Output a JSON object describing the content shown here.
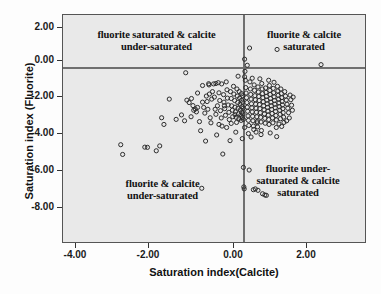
{
  "chart_data": {
    "type": "scatter",
    "title": "",
    "xlabel": "Saturation index(Calcite)",
    "ylabel": "Saturation index (Fluorite)",
    "xlim": [
      -4.7,
      3.2
    ],
    "ylim": [
      -8.6,
      2.6
    ],
    "xticks": [
      "-4.00",
      "-2.00",
      "0.00",
      "2.00"
    ],
    "xtick_values": [
      -4,
      -2,
      0,
      2
    ],
    "yticks": [
      "2.00",
      "0.00",
      "-2.00",
      "-4.00",
      "-6.00",
      "-8.00"
    ],
    "ytick_values": [
      2,
      0,
      -2,
      -4,
      -6,
      -8
    ],
    "grid": false,
    "legend": "none",
    "marker": "open-circle",
    "marker_color": "#2b2b2b",
    "plot_background": "#e9e9e9",
    "reference_lines": [
      {
        "axis": "x",
        "value": 0,
        "color": "#6f6f6f"
      },
      {
        "axis": "y",
        "value": 0,
        "color": "#6f6f6f"
      }
    ],
    "annotations": [
      {
        "id": "quad-ul",
        "text": "fluorite saturated & calcite\nunder-saturated",
        "quadrant": "upper-left"
      },
      {
        "id": "quad-ur",
        "text": "fluorite & calcite\nsaturated",
        "quadrant": "upper-right"
      },
      {
        "id": "quad-ll",
        "text": "fluorite & calcite\nunder-saturated",
        "quadrant": "lower-left"
      },
      {
        "id": "quad-lr",
        "text": "fluorite under-\nsaturated & calcite\nsaturated",
        "quadrant": "lower-right"
      }
    ],
    "points": [
      [
        -3.19,
        -3.8
      ],
      [
        -3.14,
        -4.28
      ],
      [
        -2.56,
        -3.92
      ],
      [
        -2.49,
        -3.93
      ],
      [
        -2.26,
        -4.1
      ],
      [
        -2.17,
        -3.86
      ],
      [
        -2.06,
        -2.8
      ],
      [
        -2.12,
        -2.47
      ],
      [
        -1.92,
        -1.55
      ],
      [
        -1.74,
        -2.55
      ],
      [
        -1.6,
        -2.33
      ],
      [
        -1.49,
        -0.25
      ],
      [
        -1.46,
        -1.6
      ],
      [
        -1.4,
        -1.72
      ],
      [
        -1.34,
        -1.52
      ],
      [
        -1.3,
        -1.87
      ],
      [
        -1.28,
        -2.1
      ],
      [
        -1.24,
        -2.04
      ],
      [
        -1.21,
        -2.18
      ],
      [
        -1.18,
        -1.96
      ],
      [
        -1.13,
        -2.66
      ],
      [
        -1.1,
        -3.11
      ],
      [
        -1.07,
        -5.95
      ],
      [
        -1.05,
        -1.7
      ],
      [
        -1.02,
        -1.96
      ],
      [
        -0.99,
        -2.24
      ],
      [
        -0.97,
        -3.62
      ],
      [
        -0.95,
        -1.4
      ],
      [
        -0.93,
        -1.67
      ],
      [
        -0.91,
        -2.05
      ],
      [
        -0.89,
        -0.79
      ],
      [
        -0.87,
        -1.3
      ],
      [
        -0.85,
        -2.47
      ],
      [
        -0.83,
        -2.72
      ],
      [
        -0.81,
        -1.55
      ],
      [
        -0.79,
        -1.18
      ],
      [
        -0.76,
        -0.8
      ],
      [
        -0.74,
        -1.45
      ],
      [
        -0.72,
        -2.05
      ],
      [
        -0.7,
        -2.3
      ],
      [
        -0.68,
        -3.32
      ],
      [
        -0.66,
        -1.88
      ],
      [
        -0.64,
        -0.74
      ],
      [
        -0.62,
        -1.24
      ],
      [
        -0.6,
        -1.62
      ],
      [
        -0.58,
        -2.12
      ],
      [
        -0.56,
        -2.48
      ],
      [
        -0.54,
        -2.88
      ],
      [
        -0.52,
        -4.26
      ],
      [
        -0.5,
        -1.33
      ],
      [
        -0.49,
        -1.7
      ],
      [
        -0.47,
        -2.02
      ],
      [
        -0.45,
        -2.35
      ],
      [
        -0.43,
        -0.7
      ],
      [
        -0.41,
        -1.09
      ],
      [
        -0.4,
        -1.5
      ],
      [
        -0.38,
        -1.84
      ],
      [
        -0.36,
        -2.2
      ],
      [
        -0.35,
        -2.56
      ],
      [
        -0.33,
        -3.6
      ],
      [
        -0.32,
        -1.18
      ],
      [
        -0.3,
        -1.52
      ],
      [
        -0.29,
        -1.88
      ],
      [
        -0.27,
        -2.1
      ],
      [
        -0.26,
        -2.42
      ],
      [
        -0.24,
        -0.92
      ],
      [
        -0.23,
        -1.3
      ],
      [
        -0.21,
        -1.62
      ],
      [
        -0.2,
        -1.95
      ],
      [
        -0.19,
        -2.18
      ],
      [
        -0.17,
        -2.45
      ],
      [
        -0.16,
        -2.7
      ],
      [
        -0.15,
        -1.05
      ],
      [
        -0.14,
        -1.4
      ],
      [
        -0.13,
        -1.72
      ],
      [
        -0.12,
        -2.0
      ],
      [
        -0.11,
        -2.28
      ],
      [
        -0.1,
        -2.52
      ],
      [
        -0.09,
        -1.18
      ],
      [
        -0.08,
        -1.5
      ],
      [
        -0.07,
        -1.8
      ],
      [
        -0.06,
        -2.08
      ],
      [
        -0.05,
        -2.34
      ],
      [
        -0.04,
        -2.6
      ],
      [
        -0.03,
        -1.28
      ],
      [
        -0.03,
        -1.6
      ],
      [
        -0.02,
        -1.92
      ],
      [
        -0.02,
        -2.2
      ],
      [
        -0.01,
        -2.46
      ],
      [
        -0.01,
        -3.5
      ],
      [
        0.0,
        -1.38
      ],
      [
        0.0,
        -1.7
      ],
      [
        0.01,
        -2.0
      ],
      [
        0.01,
        -2.28
      ],
      [
        0.02,
        -2.55
      ],
      [
        0.02,
        -4.92
      ],
      [
        0.03,
        -5.88
      ],
      [
        0.04,
        -5.98
      ],
      [
        0.05,
        0.42
      ],
      [
        0.06,
        -0.18
      ],
      [
        0.07,
        -0.62
      ],
      [
        0.08,
        -0.98
      ],
      [
        0.09,
        -1.25
      ],
      [
        0.1,
        -1.48
      ],
      [
        0.11,
        -1.72
      ],
      [
        0.12,
        -1.95
      ],
      [
        0.13,
        -2.15
      ],
      [
        0.14,
        -2.38
      ],
      [
        0.15,
        -2.6
      ],
      [
        0.16,
        -2.85
      ],
      [
        0.17,
        -5.05
      ],
      [
        0.18,
        0.97
      ],
      [
        0.19,
        -0.7
      ],
      [
        0.2,
        -1.05
      ],
      [
        0.21,
        -1.32
      ],
      [
        0.22,
        -1.55
      ],
      [
        0.23,
        -1.78
      ],
      [
        0.24,
        -1.98
      ],
      [
        0.25,
        -2.18
      ],
      [
        0.26,
        -2.4
      ],
      [
        0.27,
        -2.62
      ],
      [
        0.28,
        -2.88
      ],
      [
        0.29,
        -3.05
      ],
      [
        0.3,
        -0.85
      ],
      [
        0.31,
        -1.12
      ],
      [
        0.32,
        -1.38
      ],
      [
        0.33,
        -1.58
      ],
      [
        0.34,
        -1.8
      ],
      [
        0.35,
        -2.0
      ],
      [
        0.36,
        -2.2
      ],
      [
        0.37,
        -2.42
      ],
      [
        0.38,
        -2.65
      ],
      [
        0.39,
        -2.92
      ],
      [
        0.4,
        -0.95
      ],
      [
        0.41,
        -1.2
      ],
      [
        0.42,
        -1.42
      ],
      [
        0.43,
        -1.62
      ],
      [
        0.44,
        -1.82
      ],
      [
        0.45,
        -2.02
      ],
      [
        0.46,
        -2.22
      ],
      [
        0.47,
        -2.45
      ],
      [
        0.48,
        -2.68
      ],
      [
        0.49,
        -3.1
      ],
      [
        0.5,
        -0.78
      ],
      [
        0.51,
        -1.05
      ],
      [
        0.52,
        -1.28
      ],
      [
        0.53,
        -1.48
      ],
      [
        0.54,
        -1.68
      ],
      [
        0.55,
        -1.88
      ],
      [
        0.56,
        -2.08
      ],
      [
        0.57,
        -2.28
      ],
      [
        0.58,
        -2.5
      ],
      [
        0.59,
        -2.74
      ],
      [
        0.6,
        -1.0
      ],
      [
        0.61,
        -1.22
      ],
      [
        0.62,
        -1.42
      ],
      [
        0.63,
        -1.6
      ],
      [
        0.64,
        -1.78
      ],
      [
        0.65,
        -1.96
      ],
      [
        0.66,
        -2.14
      ],
      [
        0.67,
        -2.34
      ],
      [
        0.68,
        -2.56
      ],
      [
        0.69,
        -2.8
      ],
      [
        0.7,
        -0.88
      ],
      [
        0.71,
        -1.12
      ],
      [
        0.72,
        -1.32
      ],
      [
        0.73,
        -1.52
      ],
      [
        0.74,
        -1.7
      ],
      [
        0.75,
        -1.88
      ],
      [
        0.76,
        -2.06
      ],
      [
        0.77,
        -2.26
      ],
      [
        0.78,
        -2.48
      ],
      [
        0.79,
        -2.72
      ],
      [
        0.8,
        -1.02
      ],
      [
        0.81,
        -1.24
      ],
      [
        0.82,
        -1.44
      ],
      [
        0.83,
        -1.62
      ],
      [
        0.84,
        -1.8
      ],
      [
        0.85,
        -1.98
      ],
      [
        0.86,
        -2.16
      ],
      [
        0.87,
        -2.36
      ],
      [
        0.88,
        -2.58
      ],
      [
        0.89,
        -3.4
      ],
      [
        0.9,
        0.9
      ],
      [
        0.91,
        -0.92
      ],
      [
        0.92,
        -1.15
      ],
      [
        0.93,
        -1.36
      ],
      [
        0.94,
        -1.55
      ],
      [
        0.95,
        -1.74
      ],
      [
        0.96,
        -1.92
      ],
      [
        0.97,
        -2.1
      ],
      [
        0.98,
        -2.3
      ],
      [
        0.99,
        -2.52
      ],
      [
        1.0,
        -1.05
      ],
      [
        1.01,
        -1.28
      ],
      [
        1.02,
        -1.48
      ],
      [
        1.03,
        -1.66
      ],
      [
        1.04,
        -1.84
      ],
      [
        1.05,
        -2.02
      ],
      [
        1.06,
        -2.22
      ],
      [
        1.07,
        -2.44
      ],
      [
        1.08,
        -2.7
      ],
      [
        1.1,
        -1.18
      ],
      [
        1.12,
        -1.4
      ],
      [
        1.14,
        -1.6
      ],
      [
        1.16,
        -1.8
      ],
      [
        1.18,
        -2.0
      ],
      [
        1.2,
        -2.22
      ],
      [
        1.22,
        -2.48
      ],
      [
        1.24,
        -1.35
      ],
      [
        1.26,
        -1.58
      ],
      [
        1.28,
        -1.85
      ],
      [
        1.3,
        -2.1
      ],
      [
        1.32,
        -1.45
      ],
      [
        0.52,
        -6.22
      ],
      [
        0.58,
        -6.28
      ],
      [
        0.62,
        -6.3
      ],
      [
        0.4,
        -6.05
      ],
      [
        0.28,
        -6.02
      ],
      [
        0.33,
        -5.98
      ],
      [
        2.05,
        0.15
      ],
      [
        0.12,
        0.12
      ],
      [
        0.05,
        -0.45
      ],
      [
        -0.12,
        -0.42
      ],
      [
        0.45,
        -0.55
      ],
      [
        0.68,
        -0.62
      ],
      [
        0.82,
        -0.72
      ],
      [
        0.25,
        -0.52
      ],
      [
        -0.55,
        -0.8
      ],
      [
        -0.7,
        -0.78
      ],
      [
        -0.88,
        -0.85
      ],
      [
        -1.05,
        -0.88
      ],
      [
        0.15,
        -3.25
      ],
      [
        0.22,
        -3.42
      ],
      [
        0.35,
        -3.18
      ],
      [
        0.48,
        -3.3
      ],
      [
        -0.18,
        -3.18
      ],
      [
        -0.42,
        -2.95
      ],
      [
        0.05,
        -2.95
      ],
      [
        0.72,
        -3.22
      ],
      [
        0.88,
        -2.95
      ],
      [
        1.02,
        -2.9
      ],
      [
        -1.18,
        -1.25
      ],
      [
        -1.35,
        -2.42
      ],
      [
        -1.52,
        -2.62
      ],
      [
        -0.62,
        -2.8
      ],
      [
        -0.3,
        -2.75
      ],
      [
        0.95,
        -2.78
      ],
      [
        1.15,
        -2.62
      ],
      [
        -0.48,
        -1.88
      ],
      [
        -0.2,
        -2.32
      ],
      [
        0.38,
        -2.72
      ]
    ]
  }
}
